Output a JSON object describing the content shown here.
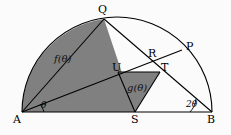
{
  "figure": {
    "type": "geometry-diagram",
    "width": 231,
    "height": 135,
    "background_color": "#fbfbfb",
    "stroke_color": "#000000",
    "shaded_fill_color": "#808080"
  },
  "points": [
    {
      "id": "A",
      "label": "A",
      "x": 22,
      "y": 112,
      "label_x": 13,
      "label_y": 114
    },
    {
      "id": "B",
      "label": "B",
      "x": 212,
      "y": 112,
      "label_x": 207,
      "label_y": 114
    },
    {
      "id": "S",
      "label": "S",
      "x": 135,
      "y": 112,
      "label_x": 131,
      "label_y": 114
    },
    {
      "id": "Q",
      "label": "Q",
      "x": 104,
      "y": 19,
      "label_x": 98,
      "label_y": 4
    },
    {
      "id": "P",
      "label": "P",
      "x": 182,
      "y": 50,
      "label_x": 186,
      "label_y": 41
    },
    {
      "id": "R",
      "label": "R",
      "x": 152,
      "y": 62,
      "label_x": 148,
      "label_y": 48
    },
    {
      "id": "T",
      "label": "T",
      "x": 160,
      "y": 72,
      "label_x": 161,
      "label_y": 62
    },
    {
      "id": "U",
      "label": "U",
      "x": 118,
      "y": 72,
      "label_x": 112,
      "label_y": 62
    }
  ],
  "regions": [
    {
      "id": "f",
      "label": "f(θ)",
      "label_x": 54,
      "label_y": 54,
      "fill": "#808080"
    },
    {
      "id": "g",
      "label": "g(θ)",
      "label_x": 127,
      "label_y": 83,
      "fill": "#808080"
    }
  ],
  "angles": [
    {
      "id": "theta-at-A",
      "label": "θ",
      "label_x": 41,
      "label_y": 101,
      "vertex": "A",
      "measure": "theta"
    },
    {
      "id": "two-theta-at-B",
      "label": "2θ",
      "label_x": 186,
      "label_y": 100,
      "vertex": "B",
      "measure": "2theta"
    }
  ],
  "shapes": {
    "semicircle": {
      "center_x": 117,
      "center_y": 112,
      "radius": 95
    },
    "diameter": {
      "from": "A",
      "to": "B"
    },
    "segments": [
      {
        "from": "A",
        "to": "Q"
      },
      {
        "from": "A",
        "to": "P"
      },
      {
        "from": "Q",
        "to": "S"
      },
      {
        "from": "B",
        "to": "Q"
      },
      {
        "from": "U",
        "to": "T"
      },
      {
        "from": "U",
        "to": "S"
      },
      {
        "from": "T",
        "to": "S"
      }
    ]
  }
}
